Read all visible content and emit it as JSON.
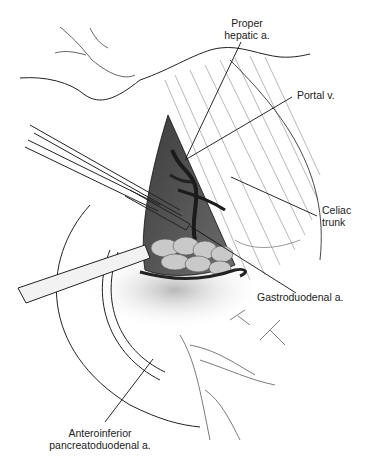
{
  "figure": {
    "type": "surgical-anatomy-illustration",
    "style": "grayscale pen-and-ink with tonal shading",
    "labels": [
      {
        "id": "proper-hepatic",
        "lines": [
          "Proper",
          "hepatic a."
        ],
        "x": 246,
        "y": 17,
        "align": "center",
        "leader": {
          "x1": 241,
          "y1": 42,
          "x2": 186,
          "y2": 158
        }
      },
      {
        "id": "portal-v",
        "lines": [
          "Portal v."
        ],
        "x": 297,
        "y": 89,
        "align": "left",
        "leader": {
          "x1": 292,
          "y1": 97,
          "x2": 185,
          "y2": 160
        }
      },
      {
        "id": "celiac-trunk",
        "lines": [
          "Celiac",
          "trunk"
        ],
        "x": 322,
        "y": 204,
        "align": "left",
        "leader": {
          "x1": 317,
          "y1": 216,
          "x2": 231,
          "y2": 177
        }
      },
      {
        "id": "gastroduodenal",
        "lines": [
          "Gastroduodenal a."
        ],
        "x": 257,
        "y": 291,
        "align": "left",
        "leader": {
          "x1": 296,
          "y1": 293,
          "x2": 190,
          "y2": 226
        }
      },
      {
        "id": "anteroinferior-pd",
        "lines": [
          "Anteroinferior",
          "pancreatoduodenal a."
        ],
        "x": 100,
        "y": 427,
        "align": "center",
        "leader": {
          "x1": 105,
          "y1": 422,
          "x2": 153,
          "y2": 359
        }
      }
    ]
  }
}
